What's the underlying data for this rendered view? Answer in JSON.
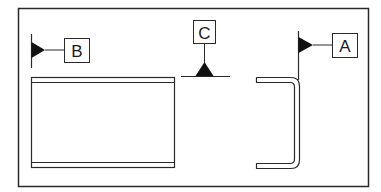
{
  "diagram": {
    "type": "welding-symbol-drawing",
    "colors": {
      "line": "#2a2a2a",
      "fill": "#111111",
      "background": "#ffffff"
    },
    "frame": {
      "x": 18,
      "y": 8,
      "width": 351,
      "height": 179
    },
    "callouts": [
      {
        "id": "B",
        "label": "B",
        "description": "fillet weld symbol, arrow pointing left to vertical reference line"
      },
      {
        "id": "C",
        "label": "C",
        "description": "fillet weld symbol on horizontal reference line"
      },
      {
        "id": "A",
        "label": "A",
        "description": "fillet weld symbol, arrow pointing left to vertical reference line"
      }
    ],
    "parts": [
      {
        "id": "plate-front-view",
        "description": "rectangular plate with flanged top and bottom edges"
      },
      {
        "id": "channel-section",
        "description": "C-shaped bent channel cross-section"
      }
    ]
  }
}
